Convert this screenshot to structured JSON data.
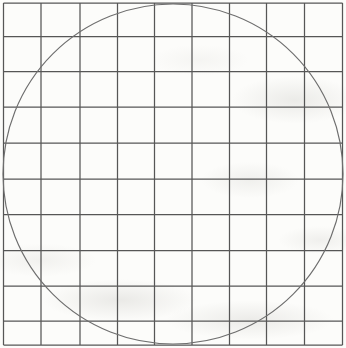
{
  "figure": {
    "type": "grid-with-inscribed-circle",
    "canvas": {
      "width": 346,
      "height": 348
    },
    "grid": {
      "columns": 9,
      "rows": 10,
      "vertical_lines_x": [
        3.5,
        41,
        80,
        117.5,
        154.5,
        192,
        229.5,
        266.5,
        304.5,
        342.5
      ],
      "horizontal_lines_y": [
        3,
        36.5,
        71.5,
        107,
        143,
        179,
        214.5,
        250.5,
        286,
        321,
        345
      ],
      "line_color": "#565656",
      "line_width": 1.25
    },
    "circle": {
      "cx": 173,
      "cy": 174,
      "r": 170,
      "stroke_color": "#6e6e6e",
      "stroke_width": 1.15,
      "fill": "none"
    },
    "background_color": "#fcfcfa"
  }
}
